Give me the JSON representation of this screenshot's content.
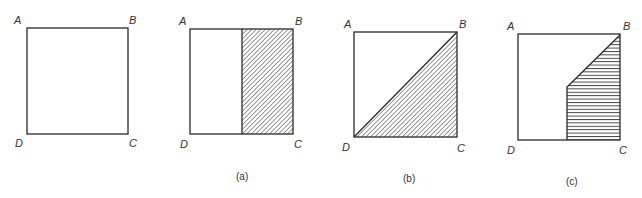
{
  "figure": {
    "panels": [
      {
        "id": "base",
        "caption": "",
        "vertices": {
          "A": "A",
          "B": "B",
          "C": "C",
          "D": "D"
        },
        "shading": "none"
      },
      {
        "id": "a",
        "caption": "(a)",
        "vertices": {
          "A": "A",
          "B": "B",
          "C": "C",
          "D": "D"
        },
        "shading": "diagonal-hatch right half rectangle"
      },
      {
        "id": "b",
        "caption": "(b)",
        "vertices": {
          "A": "A",
          "B": "B",
          "C": "C",
          "D": "D"
        },
        "shading": "diagonal-hatch triangle BCD"
      },
      {
        "id": "c",
        "caption": "(c)",
        "vertices": {
          "A": "A",
          "B": "B",
          "C": "C",
          "D": "D"
        },
        "shading": "horizontal-hatch pentagon region under diagonal, right half"
      }
    ],
    "colors": {
      "line": "#2a2a2a",
      "hatch": "#333333",
      "background": "#ffffff"
    }
  }
}
